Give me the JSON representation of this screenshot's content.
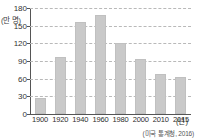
{
  "chart_data": {
    "type": "bar",
    "title": "",
    "xlabel": "년",
    "ylabel": "만 명",
    "y_unit_label": "(만 명)",
    "x_unit_label": "(년)",
    "categories": [
      "1900",
      "1920",
      "1940",
      "1960",
      "1980",
      "2000",
      "2010",
      "2015"
    ],
    "values": [
      27,
      97,
      157,
      168,
      120,
      93,
      68,
      63
    ],
    "yticks": [
      0,
      30,
      60,
      90,
      120,
      150,
      180
    ],
    "ytick_labels": [
      "0",
      "30",
      "60",
      "90",
      "120",
      "150",
      "180"
    ],
    "ylim": [
      0,
      180
    ],
    "grid": true,
    "grid_style": "dashed-horizontal",
    "legend": "none",
    "bar_color": "#c9c9c9",
    "axis_color": "#555555",
    "grid_color": "#b9b9b9",
    "source_note": "(미국 통계청, 2016)"
  }
}
